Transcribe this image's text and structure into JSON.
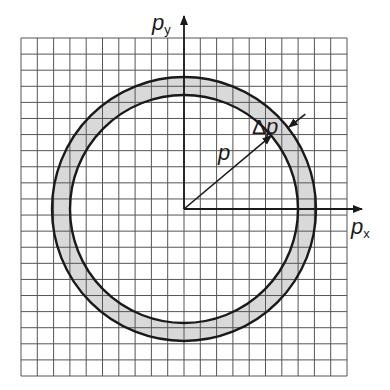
{
  "diagram": {
    "colors": {
      "grid": "#555555",
      "axis": "#1a1a1a",
      "circle": "#1a1a1a",
      "shell_fill": "#d9d9d9",
      "background": "#ffffff"
    },
    "grid": {
      "x0": 21,
      "y0": 38,
      "x1": 347,
      "y1": 376,
      "cols": 20,
      "rows": 21
    },
    "origin": {
      "x": 184,
      "y": 209
    },
    "shell": {
      "outer_radius": 132,
      "inner_radius": 114
    },
    "axes": {
      "x": {
        "label_main": "p",
        "label_sub": "x",
        "end_x": 362
      },
      "y": {
        "label_main": "p",
        "label_sub": "y",
        "end_y": 16
      }
    },
    "vectors": {
      "radius": {
        "label": "p"
      },
      "thickness": {
        "label_delta": "Δ",
        "label_main": "p"
      }
    }
  }
}
